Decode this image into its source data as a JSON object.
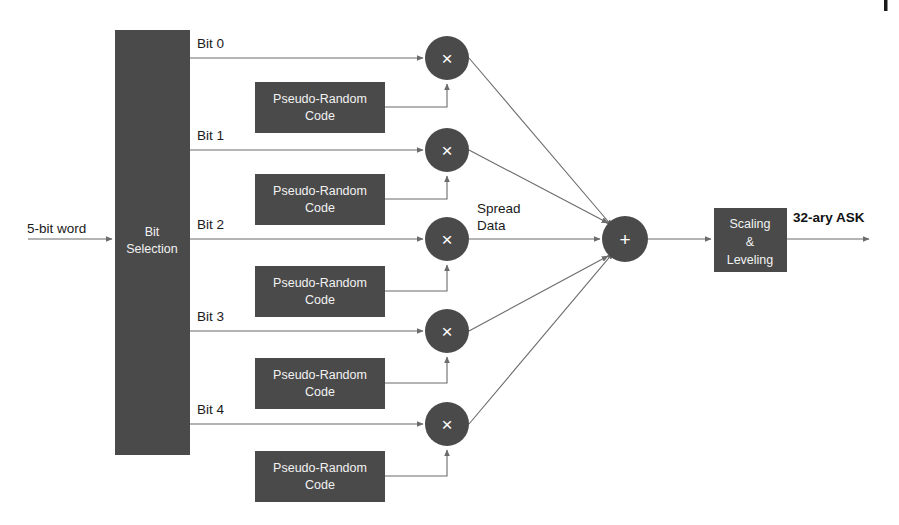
{
  "figure": {
    "background_color": "#ffffff",
    "block_fill_color": "#4a4a4a",
    "block_text_color": "#f2f2f2",
    "wire_color": "#6b6b6b",
    "label_color": "#1a1a1a"
  },
  "page_marker": {
    "name": "page-rule-mark",
    "visible": true
  },
  "input": {
    "label": "5-bit word"
  },
  "bit_selection": {
    "line1": "Bit",
    "line2": "Selection"
  },
  "bit_taps": [
    {
      "label": "Bit 0"
    },
    {
      "label": "Bit 1"
    },
    {
      "label": "Bit 2"
    },
    {
      "label": "Bit 3"
    },
    {
      "label": "Bit 4"
    }
  ],
  "pn_blocks": [
    {
      "line1": "Pseudo-Random",
      "line2": "Code"
    },
    {
      "line1": "Pseudo-Random",
      "line2": "Code"
    },
    {
      "line1": "Pseudo-Random",
      "line2": "Code"
    },
    {
      "line1": "Pseudo-Random",
      "line2": "Code"
    },
    {
      "line1": "Pseudo-Random",
      "line2": "Code"
    }
  ],
  "multipliers": [
    {
      "glyph": "×"
    },
    {
      "glyph": "×"
    },
    {
      "glyph": "×"
    },
    {
      "glyph": "×"
    },
    {
      "glyph": "×"
    }
  ],
  "spread_data": {
    "line1": "Spread",
    "line2": "Data"
  },
  "summer": {
    "glyph": "+"
  },
  "scaling_block": {
    "line1": "Scaling",
    "line2": "&",
    "line3": "Leveling"
  },
  "output": {
    "label": "32-ary ASK"
  }
}
